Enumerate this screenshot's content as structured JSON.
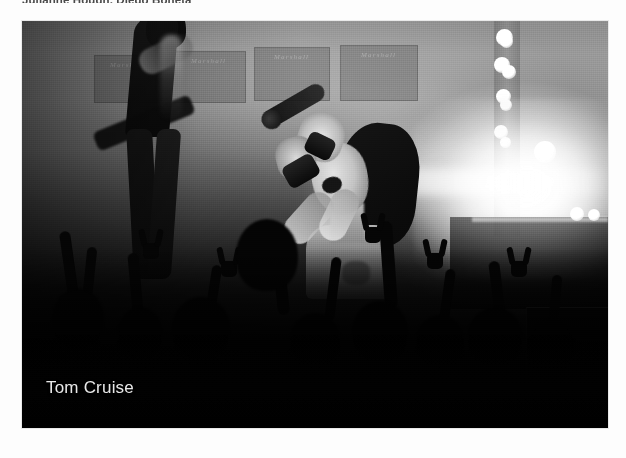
{
  "page": {
    "background_color": "#fdfdfd"
  },
  "cast_credit": {
    "text": "Julianne Hough, Diego Boneta",
    "color": "#4a4a4a",
    "clipped": true
  },
  "photo": {
    "caption": "Tom Cruise",
    "caption_color": "#e8e8e8",
    "frame": {
      "x": 22,
      "y": 21,
      "width": 586,
      "height": 407,
      "border_color": "#e9e9e9"
    },
    "scene": {
      "setting": "concert stage",
      "tone": "black-and-white",
      "background_items": [
        {
          "label": "Marshall",
          "x": 72,
          "y": 34,
          "width": 66,
          "height": 46
        },
        {
          "label": "Marshall",
          "x": 150,
          "y": 30,
          "width": 72,
          "height": 50
        },
        {
          "label": "Marshall",
          "x": 232,
          "y": 26,
          "width": 74,
          "height": 52
        },
        {
          "label": "Marshall",
          "x": 318,
          "y": 24,
          "width": 76,
          "height": 54
        }
      ],
      "truss_lamps": [
        {
          "x": 474,
          "y": 8,
          "size": 17
        },
        {
          "x": 478,
          "y": 14,
          "size": 13
        },
        {
          "x": 472,
          "y": 36,
          "size": 16
        },
        {
          "x": 480,
          "y": 44,
          "size": 14
        },
        {
          "x": 474,
          "y": 68,
          "size": 15
        },
        {
          "x": 478,
          "y": 78,
          "size": 12
        },
        {
          "x": 472,
          "y": 104,
          "size": 14
        },
        {
          "x": 478,
          "y": 116,
          "size": 11
        }
      ],
      "stage_lamps": [
        {
          "x": 512,
          "y": 120,
          "size": 22
        },
        {
          "x": 548,
          "y": 186,
          "size": 14
        },
        {
          "x": 566,
          "y": 188,
          "size": 12
        }
      ],
      "crowd_heads": [
        {
          "x": 30,
          "y": 268,
          "w": 52,
          "h": 58
        },
        {
          "x": 96,
          "y": 286,
          "w": 44,
          "h": 50
        },
        {
          "x": 150,
          "y": 276,
          "w": 58,
          "h": 62
        },
        {
          "x": 214,
          "y": 198,
          "w": 62,
          "h": 72
        },
        {
          "x": 268,
          "y": 292,
          "w": 50,
          "h": 54
        },
        {
          "x": 330,
          "y": 280,
          "w": 56,
          "h": 60
        },
        {
          "x": 394,
          "y": 294,
          "w": 48,
          "h": 52
        },
        {
          "x": 446,
          "y": 286,
          "w": 54,
          "h": 58
        },
        {
          "x": 506,
          "y": 300,
          "w": 46,
          "h": 50
        }
      ],
      "crowd_arms": [
        {
          "x": 42,
          "y": 210,
          "w": 11,
          "h": 74,
          "rot": -8
        },
        {
          "x": 62,
          "y": 226,
          "w": 10,
          "h": 66,
          "rot": 6
        },
        {
          "x": 108,
          "y": 232,
          "w": 11,
          "h": 62,
          "rot": -5
        },
        {
          "x": 186,
          "y": 244,
          "w": 10,
          "h": 58,
          "rot": 9
        },
        {
          "x": 252,
          "y": 214,
          "w": 12,
          "h": 80,
          "rot": -6
        },
        {
          "x": 306,
          "y": 236,
          "w": 10,
          "h": 64,
          "rot": 7
        },
        {
          "x": 360,
          "y": 200,
          "w": 13,
          "h": 88,
          "rot": -4
        },
        {
          "x": 420,
          "y": 248,
          "w": 10,
          "h": 58,
          "rot": 8
        },
        {
          "x": 470,
          "y": 240,
          "w": 11,
          "h": 64,
          "rot": -7
        },
        {
          "x": 528,
          "y": 254,
          "w": 10,
          "h": 56,
          "rot": 5
        }
      ],
      "crowd_horns": [
        {
          "x": 118,
          "y": 208
        },
        {
          "x": 196,
          "y": 226
        },
        {
          "x": 340,
          "y": 192
        },
        {
          "x": 402,
          "y": 218
        },
        {
          "x": 486,
          "y": 226
        }
      ]
    }
  }
}
